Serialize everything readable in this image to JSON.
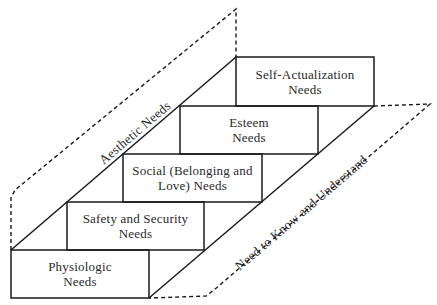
{
  "diagram": {
    "type": "staircase-hierarchy",
    "steps": [
      {
        "label": "Physiologic\nNeeds",
        "line1": "Physiologic",
        "line2": "Needs"
      },
      {
        "label": "Safety and Security\nNeeds",
        "line1": "Safety and Security",
        "line2": "Needs"
      },
      {
        "label": "Social (Belonging and\nLove) Needs",
        "line1": "Social (Belonging and",
        "line2": "Love) Needs"
      },
      {
        "label": "Esteem\nNeeds",
        "line1": "Esteem",
        "line2": "Needs"
      },
      {
        "label": "Self-Actualization\nNeeds",
        "line1": "Self-Actualization",
        "line2": "Needs"
      }
    ],
    "side_panels": {
      "left": "Aesthetic Needs",
      "right": "Need to Know and Understand"
    },
    "colors": {
      "line": "#1a1a1a",
      "text": "#2a2a2a",
      "background": "#ffffff"
    }
  }
}
